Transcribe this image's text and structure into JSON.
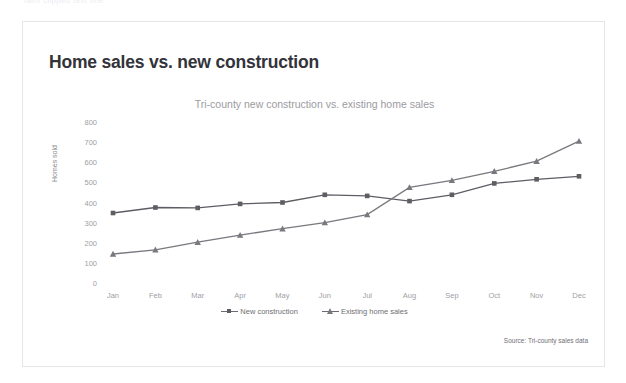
{
  "top_strip": {
    "text": "faint clipped text line"
  },
  "card": {
    "title": "Home sales vs. new construction",
    "source_note": "Source: Tri-county sales data"
  },
  "legend": {
    "items": [
      {
        "label": "New construction",
        "marker": "square-marker-icon",
        "color": "#5d5d63"
      },
      {
        "label": "Existing home sales",
        "marker": "triangle-marker-icon",
        "color": "#78787e"
      }
    ]
  },
  "chart_data": {
    "type": "line",
    "title": "Tri-county new construction vs. existing home sales",
    "xlabel": "",
    "ylabel": "Homes sold",
    "categories": [
      "Jan",
      "Feb",
      "Mar",
      "Apr",
      "May",
      "Jun",
      "Jul",
      "Aug",
      "Sep",
      "Oct",
      "Nov",
      "Dec"
    ],
    "yticks": [
      0,
      100,
      200,
      300,
      400,
      500,
      600,
      700,
      800
    ],
    "ylim": [
      0,
      800
    ],
    "grid": false,
    "legend_position": "bottom",
    "series": [
      {
        "name": "New construction",
        "marker": "square",
        "color": "#5d5d63",
        "values": [
          353,
          380,
          378,
          398,
          405,
          443,
          438,
          412,
          443,
          500,
          520,
          535
        ]
      },
      {
        "name": "Existing home sales",
        "marker": "triangle",
        "color": "#78787e",
        "values": [
          149,
          170,
          208,
          243,
          275,
          305,
          345,
          480,
          515,
          560,
          610,
          710
        ]
      }
    ]
  }
}
